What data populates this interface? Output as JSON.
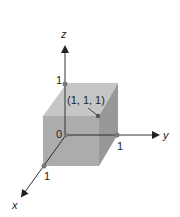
{
  "axes": {
    "x": "x",
    "y": "y",
    "z": "z"
  },
  "ticks": {
    "x": "1",
    "y": "1",
    "z": "1",
    "origin": "0"
  },
  "point_label": "(1, 1, 1)",
  "colors": {
    "cube_front": "#a6a6a6",
    "cube_top": "#c4c4c4",
    "cube_right": "#9a9a9a",
    "axis": "#333333",
    "dot": "#777777"
  }
}
